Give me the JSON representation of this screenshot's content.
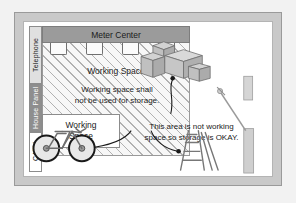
{
  "diagram": {
    "title_bar": {
      "label": "Meter Center"
    },
    "side_labels": [
      {
        "name": "telephone",
        "label": "Telephone"
      },
      {
        "name": "house-panel",
        "label": "House Panel"
      },
      {
        "name": "catv",
        "label": "CATV"
      }
    ],
    "working_space_label": "Working Space",
    "rule_text_line1": "Working space shall",
    "rule_text_line2": "not be used for storage.",
    "lower_box": {
      "line1": "Working",
      "line2": "Space"
    },
    "note_line1": "This area is not working",
    "note_line2": "space so storage is OKAY.",
    "meter_count": 4,
    "objects": [
      {
        "name": "stacked-boxes",
        "label": "cardboard boxes"
      },
      {
        "name": "step-ladder",
        "label": "step ladder"
      },
      {
        "name": "bicycle",
        "label": "bicycle"
      },
      {
        "name": "leaning-tool",
        "label": "leaning tool"
      }
    ],
    "colors": {
      "wall": "#c9c9c9",
      "meter_bar": "#9b9b9b",
      "panel_strip": "#8e8e8e",
      "hatch_line": "#787878",
      "leader_line": "#1a1a1a"
    }
  }
}
